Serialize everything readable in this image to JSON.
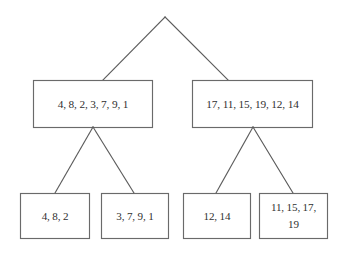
{
  "diagram": {
    "kind": "merge-sort-split-tree",
    "background_color": "#ffffff",
    "line_color": "#5b5b5b",
    "box_border_color": "#6a6a6a",
    "text_color": "#2f2f2f",
    "root": {
      "label": "",
      "has_box": false
    },
    "level_two": {
      "left": "4, 8, 2, 3, 7, 9, 1",
      "right": "17, 11, 15, 19, 12, 14"
    },
    "level_three": {
      "leaf_one": "4, 8, 2",
      "leaf_two": "3, 7, 9, 1",
      "leaf_three": "12, 14",
      "leaf_four_line_one": "11, 15, 17,",
      "leaf_four_line_two": "19"
    }
  }
}
